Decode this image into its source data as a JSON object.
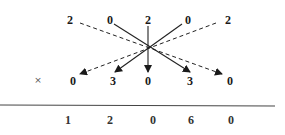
{
  "diagram": {
    "type": "cross-multiplication",
    "multiplicand": {
      "digits": [
        "2",
        "0",
        "2",
        "0",
        "2"
      ]
    },
    "operator": "×",
    "multiplier": {
      "digits": [
        "0",
        "3",
        "0",
        "3",
        "0"
      ]
    },
    "result": {
      "digits": [
        "1",
        "2",
        "0",
        "6",
        "0"
      ]
    },
    "arrows": [
      {
        "from": "multiplicand.0",
        "to": "multiplier.4",
        "style": "dashed"
      },
      {
        "from": "multiplicand.1",
        "to": "multiplier.3",
        "style": "solid"
      },
      {
        "from": "multiplicand.2",
        "to": "multiplier.2",
        "style": "solid"
      },
      {
        "from": "multiplicand.3",
        "to": "multiplier.1",
        "style": "solid"
      },
      {
        "from": "multiplicand.4",
        "to": "multiplier.0",
        "style": "dashed"
      }
    ],
    "colors": {
      "ink": "#1a1a1a",
      "line": "#444444",
      "background": "#ffffff"
    }
  }
}
